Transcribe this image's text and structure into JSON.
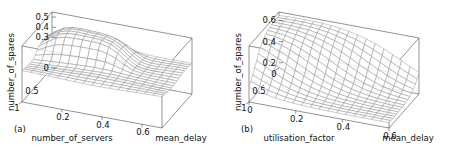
{
  "figure": {
    "background": "#ffffff",
    "line_color": "#8d8d8d",
    "axis_color": "#4a4a4a",
    "panel_count": 2
  },
  "chart_data": [
    {
      "type": "surface",
      "panel_label": "(a)",
      "title": "",
      "xlabel": "number_of_servers",
      "ylabel": "mean_delay",
      "zlabel": "number_of_spares",
      "xticks": [
        "0.5",
        "1"
      ],
      "xtick_values": [
        0.5,
        1
      ],
      "yticks": [
        "0.6",
        "0.4",
        "0.2"
      ],
      "ytick_values": [
        0.6,
        0.4,
        0.2
      ],
      "zticks": [
        "0.5",
        "0.4",
        "0.3",
        "0"
      ],
      "ztick_values": [
        0.5,
        0.4,
        0.3,
        0.0
      ],
      "xlim": [
        0,
        1
      ],
      "ylim": [
        0,
        0.7
      ],
      "zlim": [
        0,
        0.55
      ],
      "grid": true,
      "legend": "none",
      "description": "Flat low plateau near 0.3 with a broad raised ridge rising to about 0.5 over the low-server / low-delay region",
      "surface": {
        "nx": 16,
        "ny": 16,
        "z_low": 0.3,
        "z_high": 0.52,
        "ridge_center_x": 0.3,
        "ridge_center_y": 0.32,
        "ridge_width_x": 0.22,
        "ridge_width_y": 0.26
      }
    },
    {
      "type": "surface",
      "panel_label": "(b)",
      "title": "",
      "xlabel": "utilisation_factor",
      "ylabel": "mean_delay",
      "zlabel": "number_of_spares",
      "xticks": [
        "1",
        "0.5",
        "0"
      ],
      "xtick_values": [
        1,
        0.5,
        0
      ],
      "yticks": [
        "0",
        "0.2",
        "0.4",
        "0.6"
      ],
      "ytick_values": [
        0,
        0.2,
        0.4,
        0.6
      ],
      "zticks": [
        "0.6",
        "0.4",
        "0.2"
      ],
      "ztick_values": [
        0.6,
        0.4,
        0.2
      ],
      "xlim": [
        0,
        1
      ],
      "ylim": [
        0,
        0.6
      ],
      "zlim": [
        0.15,
        0.68
      ],
      "grid": true,
      "legend": "none",
      "description": "Sigmoid step surface, high near 0.65 at low utilisation / low delay falling to about 0.2 at high utilisation and high delay",
      "surface": {
        "nx": 16,
        "ny": 16,
        "z_low": 0.2,
        "z_high": 0.65,
        "step_center": 0.52,
        "step_sharpness": 11
      }
    }
  ]
}
